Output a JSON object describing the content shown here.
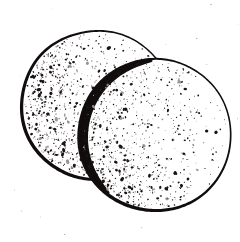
{
  "artwork": {
    "title": "Two overlapping stippled discs",
    "subject": "two round wafer-like discs, one partly behind the other",
    "style": "black ink line drawing with stipple shading",
    "technique": "stipple",
    "background_color": "#ffffff",
    "ink_color": "#100d0c",
    "canvas": {
      "width": 240,
      "height": 242
    },
    "alt_text": "Black and white stippled drawing of two overlapping circular discs"
  },
  "shapes": [
    {
      "name": "back-disc",
      "label": "Back disc",
      "type": "circle",
      "cx": 97,
      "cy": 105,
      "r": 75,
      "outline_color": "#100d0c",
      "fill_color": "#ffffff",
      "stroke_min": 1.4,
      "stroke_max": 3.4,
      "z": 1,
      "stipple_seed": 1277,
      "stipple_count": 720,
      "stipple_bias": "dense-left-sparse-right"
    },
    {
      "name": "front-disc",
      "label": "Front disc",
      "type": "circle",
      "cx": 155,
      "cy": 135,
      "r": 76,
      "outline_color": "#100d0c",
      "fill_color": "#ffffff",
      "stroke_min": 1.5,
      "stroke_max": 3.6,
      "z": 2,
      "stipple_seed": 9043,
      "stipple_count": 880,
      "stipple_bias": "dense-left-sparse-right"
    }
  ],
  "shadow_arc": {
    "name": "overlap-shadow",
    "label": "Contact shadow on front disc upper-left limb",
    "color": "#100d0c",
    "cx": 155,
    "cy": 135,
    "r": 76,
    "start_angle_deg": 128,
    "end_angle_deg": 268,
    "max_width": 9,
    "min_width": 2
  },
  "bounds": {
    "back_disc": {
      "left": 22,
      "top": 22,
      "right": 172,
      "bottom": 188
    },
    "front_disc": {
      "left": 80,
      "top": 59,
      "right": 230,
      "bottom": 211
    }
  },
  "palette": {
    "ink": "#100d0c",
    "paper": "#ffffff",
    "stipple": "#1a1514",
    "faint_speck": "#9a9492"
  }
}
